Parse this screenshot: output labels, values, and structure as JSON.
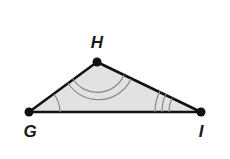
{
  "diagram": {
    "type": "triangle",
    "vertices": [
      {
        "label": "H",
        "x": 97,
        "y": 62,
        "lx": 97,
        "ly": 48
      },
      {
        "label": "G",
        "x": 29,
        "y": 112,
        "lx": 30,
        "ly": 137
      },
      {
        "label": "I",
        "x": 201,
        "y": 112,
        "lx": 201,
        "ly": 137
      }
    ],
    "angle_marks": {
      "G": 1,
      "H": 2,
      "I": 3
    },
    "colors": {
      "fill": "#e2e2e2",
      "stroke": "#111111",
      "arc": "#888888"
    }
  }
}
